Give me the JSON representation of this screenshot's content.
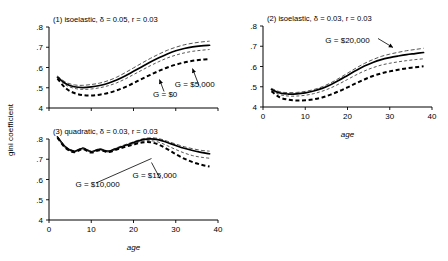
{
  "figure": {
    "ylabel": "gini coefficient",
    "xlabel": "age"
  },
  "chart_data": [
    {
      "type": "line",
      "panel": 1,
      "title": "(1) isoelastic, δ = 0.05, r = 0.03",
      "xlabel": "",
      "ylabel": "gini coefficient",
      "xlim": [
        0,
        40
      ],
      "ylim": [
        0.4,
        0.8
      ],
      "xticks": [
        0,
        10,
        20,
        30,
        40
      ],
      "xticklabels": [
        "",
        "",
        "",
        "",
        ""
      ],
      "yticks": [
        0.4,
        0.5,
        0.6,
        0.7,
        0.8
      ],
      "yticklabels": [
        "4",
        ".5",
        ".6",
        ".7",
        ".8"
      ],
      "grid": false,
      "legend": "annotations",
      "annotations": [
        {
          "text": "G = $0",
          "x": 27.5,
          "y": 0.455
        },
        {
          "text": "G = $5,000",
          "x": 34.5,
          "y": 0.505
        }
      ],
      "x": [
        2,
        4,
        6,
        8,
        10,
        12,
        14,
        16,
        18,
        20,
        22,
        24,
        26,
        28,
        30,
        32,
        34,
        36,
        38
      ],
      "series": [
        {
          "name": "upper-dashed-gray",
          "style": "dashed-gray",
          "values": [
            0.558,
            0.527,
            0.514,
            0.512,
            0.516,
            0.523,
            0.535,
            0.552,
            0.574,
            0.598,
            0.622,
            0.645,
            0.666,
            0.685,
            0.7,
            0.712,
            0.72,
            0.726,
            0.73
          ]
        },
        {
          "name": "solid-thick",
          "style": "solid-thick",
          "values": [
            0.552,
            0.52,
            0.505,
            0.501,
            0.504,
            0.511,
            0.522,
            0.538,
            0.558,
            0.581,
            0.604,
            0.627,
            0.648,
            0.667,
            0.683,
            0.694,
            0.702,
            0.707,
            0.71
          ]
        },
        {
          "name": "thin-dashed",
          "style": "dashed-thin",
          "values": [
            0.548,
            0.513,
            0.497,
            0.492,
            0.494,
            0.5,
            0.51,
            0.524,
            0.543,
            0.565,
            0.587,
            0.609,
            0.629,
            0.647,
            0.661,
            0.672,
            0.68,
            0.685,
            0.689
          ]
        },
        {
          "name": "heavy-dashed",
          "style": "dashed-heavy",
          "values": [
            0.545,
            0.497,
            0.474,
            0.464,
            0.462,
            0.466,
            0.474,
            0.487,
            0.503,
            0.523,
            0.544,
            0.564,
            0.583,
            0.6,
            0.614,
            0.625,
            0.633,
            0.638,
            0.641
          ]
        }
      ]
    },
    {
      "type": "line",
      "panel": 2,
      "title": "(2) isoelastic, δ = 0.03, r = 0.03",
      "xlabel": "age",
      "ylabel": "",
      "xlim": [
        0,
        40
      ],
      "ylim": [
        0.4,
        0.8
      ],
      "xticks": [
        0,
        10,
        20,
        30,
        40
      ],
      "xticklabels": [
        "0",
        "10",
        "20",
        "30",
        "40"
      ],
      "yticks": [
        0.4,
        0.5,
        0.6,
        0.7,
        0.8
      ],
      "yticklabels": [
        "4",
        ".5",
        ".6",
        ".7",
        ".8"
      ],
      "grid": false,
      "legend": "annotations",
      "annotations": [
        {
          "text": "G = $20,000",
          "x": 20.0,
          "y": 0.715
        }
      ],
      "x": [
        2,
        4,
        6,
        8,
        10,
        12,
        14,
        16,
        18,
        20,
        22,
        24,
        26,
        28,
        30,
        32,
        34,
        36,
        38
      ],
      "series": [
        {
          "name": "upper-dashed-gray",
          "style": "dashed-gray",
          "values": [
            0.492,
            0.475,
            0.471,
            0.472,
            0.477,
            0.486,
            0.5,
            0.519,
            0.542,
            0.567,
            0.592,
            0.615,
            0.634,
            0.65,
            0.661,
            0.67,
            0.678,
            0.684,
            0.69
          ]
        },
        {
          "name": "solid-thick",
          "style": "solid-thick",
          "values": [
            0.487,
            0.469,
            0.464,
            0.465,
            0.47,
            0.479,
            0.492,
            0.51,
            0.532,
            0.556,
            0.58,
            0.602,
            0.62,
            0.634,
            0.644,
            0.652,
            0.659,
            0.664,
            0.669
          ]
        },
        {
          "name": "thin-dashed",
          "style": "dashed-thin",
          "values": [
            0.482,
            0.461,
            0.454,
            0.454,
            0.458,
            0.466,
            0.478,
            0.494,
            0.514,
            0.536,
            0.558,
            0.578,
            0.594,
            0.607,
            0.616,
            0.623,
            0.629,
            0.634,
            0.638
          ]
        },
        {
          "name": "heavy-dashed",
          "style": "dashed-heavy",
          "values": [
            0.478,
            0.447,
            0.436,
            0.432,
            0.433,
            0.438,
            0.447,
            0.461,
            0.478,
            0.497,
            0.517,
            0.536,
            0.553,
            0.566,
            0.576,
            0.584,
            0.591,
            0.596,
            0.601
          ]
        }
      ]
    },
    {
      "type": "line",
      "panel": 3,
      "title": "(3) quadratic, δ = 0.03, r = 0.03",
      "xlabel": "age",
      "ylabel": "",
      "xlim": [
        0,
        40
      ],
      "ylim": [
        0.4,
        0.8
      ],
      "xticks": [
        0,
        10,
        20,
        30,
        40
      ],
      "xticklabels": [
        "0",
        "10",
        "20",
        "30",
        "40"
      ],
      "yticks": [
        0.4,
        0.5,
        0.6,
        0.7,
        0.8
      ],
      "yticklabels": [
        "4",
        ".5",
        ".6",
        ".7",
        ".8"
      ],
      "grid": false,
      "legend": "annotations",
      "annotations": [
        {
          "text": "G = $10,000",
          "x": 11.5,
          "y": 0.565
        },
        {
          "text": "G = $15,000",
          "x": 25.0,
          "y": 0.605
        }
      ],
      "x": [
        2,
        4,
        6,
        8,
        10,
        12,
        14,
        16,
        18,
        20,
        22,
        24,
        26,
        28,
        30,
        32,
        34,
        36,
        38
      ],
      "series": [
        {
          "name": "upper-dashed-gray",
          "style": "dashed-gray",
          "values": [
            0.812,
            0.762,
            0.742,
            0.757,
            0.74,
            0.752,
            0.742,
            0.757,
            0.772,
            0.786,
            0.8,
            0.806,
            0.802,
            0.789,
            0.775,
            0.762,
            0.752,
            0.744,
            0.74
          ]
        },
        {
          "name": "solid-thick",
          "style": "solid-thick",
          "values": [
            0.81,
            0.758,
            0.739,
            0.754,
            0.737,
            0.749,
            0.739,
            0.753,
            0.768,
            0.782,
            0.796,
            0.801,
            0.796,
            0.783,
            0.768,
            0.754,
            0.743,
            0.734,
            0.727
          ]
        },
        {
          "name": "thin-dashed",
          "style": "dashed-thin",
          "values": [
            0.808,
            0.756,
            0.737,
            0.752,
            0.735,
            0.747,
            0.737,
            0.75,
            0.764,
            0.777,
            0.789,
            0.792,
            0.784,
            0.767,
            0.748,
            0.731,
            0.718,
            0.71,
            0.705
          ]
        },
        {
          "name": "heavy-dashed",
          "style": "dashed-heavy",
          "values": [
            0.806,
            0.754,
            0.735,
            0.75,
            0.733,
            0.745,
            0.735,
            0.748,
            0.761,
            0.773,
            0.783,
            0.784,
            0.772,
            0.75,
            0.725,
            0.703,
            0.686,
            0.673,
            0.664
          ]
        }
      ]
    }
  ]
}
